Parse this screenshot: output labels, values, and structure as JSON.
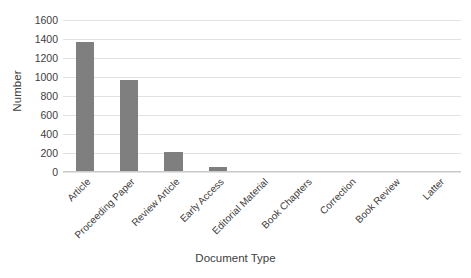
{
  "chart_data": {
    "type": "bar",
    "title": "",
    "xlabel": "Document Type",
    "ylabel": "Number",
    "categories": [
      "Article",
      "Proceeding Paper",
      "Review Article",
      "Early Access",
      "Editorial Material",
      "Book Chapters",
      "Correction",
      "Book Review",
      "Latter"
    ],
    "values": [
      1370,
      965,
      210,
      55,
      10,
      10,
      10,
      10,
      8
    ],
    "ylim": [
      0,
      1600
    ],
    "ytick_values": [
      0,
      200,
      400,
      600,
      800,
      1000,
      1200,
      1400,
      1600
    ],
    "ytick_labels": [
      "0",
      "200",
      "400",
      "600",
      "800",
      "1000",
      "1200",
      "1400",
      "1600"
    ],
    "grid": true,
    "legend": false,
    "legend_position": "none",
    "bar_color": "#7f7f7f",
    "gridline_color": "#e2e2e2",
    "axis_color": "#c9c9c9",
    "text_color": "#404040",
    "background_color": "#ffffff",
    "xtick_rotation": -45
  }
}
